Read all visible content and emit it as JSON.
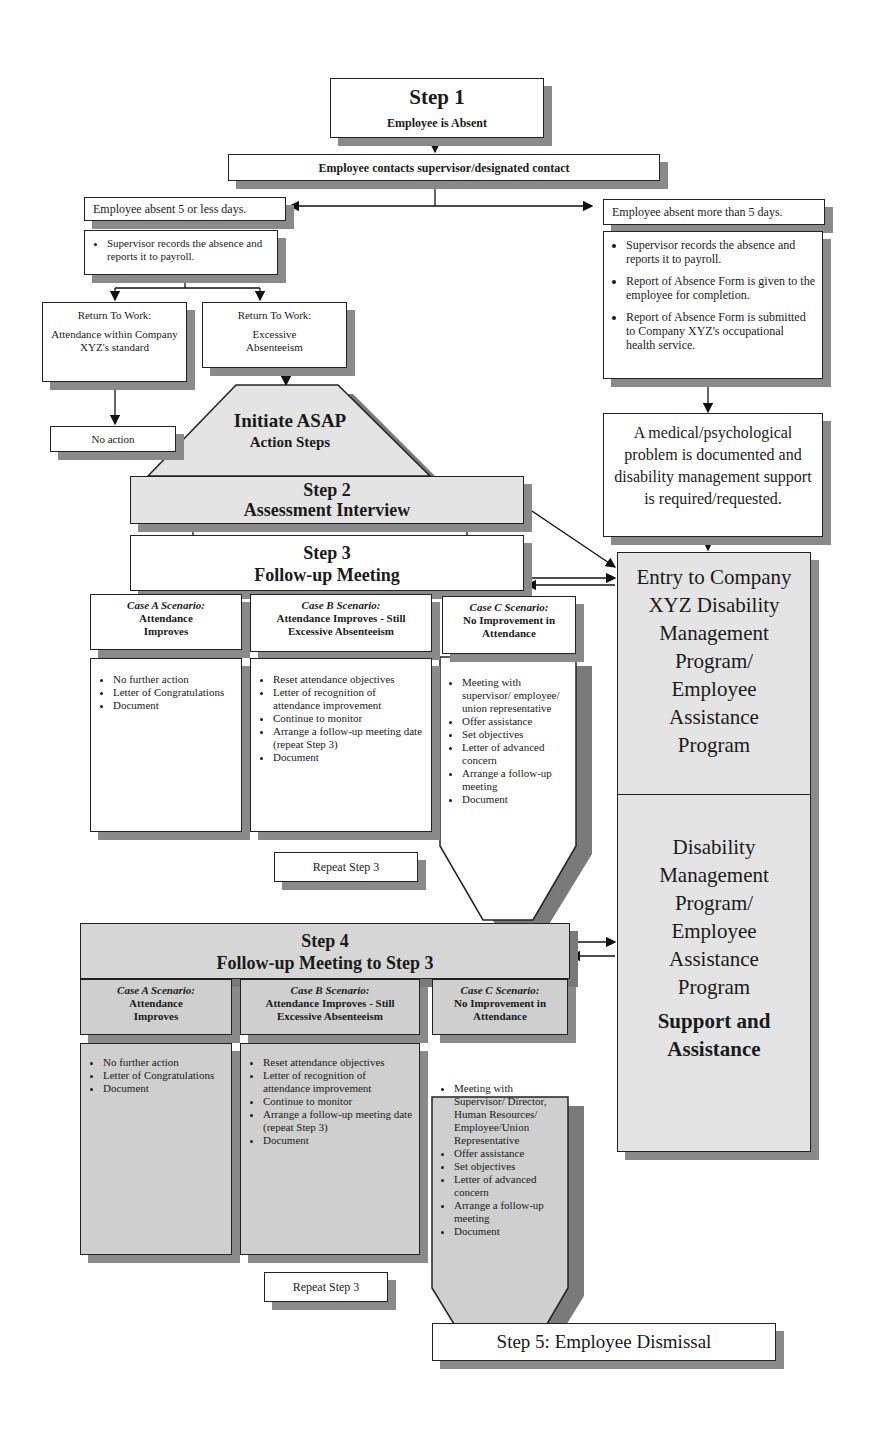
{
  "step1": {
    "title": "Step 1",
    "subtitle": "Employee is Absent"
  },
  "contact": "Employee contacts supervisor/designated contact",
  "left_branch": {
    "label": "Employee absent 5 or less days.",
    "actions": [
      "Supervisor records the absence and reports it to payroll."
    ],
    "rtw_ok": {
      "title": "Return To Work:",
      "body": "Attendance within Company XYZ's standard"
    },
    "rtw_excess": {
      "title": "Return To Work:",
      "body": "Excessive Absenteeism"
    },
    "no_action": "No action"
  },
  "right_branch": {
    "label": "Employee absent more than 5 days.",
    "actions": [
      "Supervisor records the absence and  reports it to payroll.",
      "Report of Absence Form is given to the employee for completion.",
      "Report of Absence Form is submitted to Company XYZ's occupational  health service."
    ],
    "medical": "A medical/psychological problem is documented and disability management support is required/requested."
  },
  "asap": {
    "line1": "Initiate ASAP",
    "line2": "Action Steps"
  },
  "step2": {
    "title": "Step 2",
    "subtitle": "Assessment Interview"
  },
  "step3": {
    "title": "Step 3",
    "subtitle": "Follow-up Meeting",
    "cases": [
      {
        "label": "Case A Scenario:",
        "heading": "Attendance Improves",
        "items": [
          "No further action",
          "Letter of Congratulations",
          "Document"
        ]
      },
      {
        "label": "Case B Scenario:",
        "heading": "Attendance Improves - Still Excessive Absenteeism",
        "items": [
          "Reset attendance objectives",
          "Letter of recognition of attendance improvement",
          "Continue to monitor",
          "Arrange a follow-up meeting date (repeat Step 3)",
          "Document"
        ]
      },
      {
        "label": "Case C Scenario:",
        "heading": "No Improvement in Attendance",
        "items": [
          "Meeting with supervisor/ employee/ union representative",
          "Offer assistance",
          "Set objectives",
          "Letter of advanced concern",
          "Arrange a follow-up meeting",
          "Document"
        ]
      }
    ],
    "repeat": "Repeat Step 3"
  },
  "step4": {
    "title": "Step 4",
    "subtitle": "Follow-up Meeting to Step 3",
    "cases": [
      {
        "label": "Case A Scenario:",
        "heading": "Attendance Improves",
        "items": [
          "No further action",
          "Letter of Congratulations",
          "Document"
        ]
      },
      {
        "label": "Case B Scenario:",
        "heading": "Attendance Improves - Still Excessive Absenteeism",
        "items": [
          "Reset attendance objectives",
          "Letter of recognition of attendance improvement",
          "Continue to monitor",
          "Arrange a follow-up meeting date (repeat Step 3)",
          "Document"
        ]
      },
      {
        "label": "Case C Scenario:",
        "heading": "No Improvement in Attendance",
        "items": [
          "Meeting with Supervisor/ Director, Human Resources/ Employee/Union Representative",
          "Offer assistance",
          "Set objectives",
          "Letter of advanced concern",
          "Arrange a follow-up meeting",
          "Document"
        ]
      }
    ],
    "repeat": "Repeat Step 3"
  },
  "program_panel": {
    "entry": "Entry to Company XYZ Disability Management Program/ Employee Assistance Program",
    "program": "Disability Management Program/ Employee Assistance Program",
    "support": "Support and Assistance"
  },
  "step5": "Step 5:  Employee Dismissal"
}
